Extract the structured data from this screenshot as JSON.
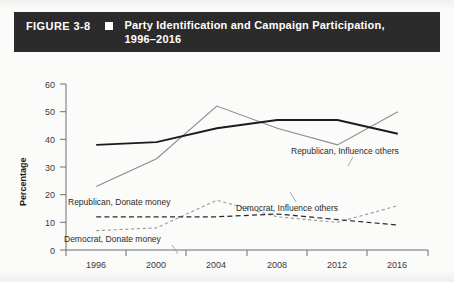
{
  "figure": {
    "number": "FIGURE 3-8",
    "bullet_icon": "square-bullet-icon",
    "title_line1": "Party Identification and Campaign Participation,",
    "title_line2": "1996–2016"
  },
  "chart_data": {
    "type": "line",
    "title": "Party Identification and Campaign Participation, 1996–2016",
    "xlabel": "",
    "ylabel": "Percentage",
    "categories": [
      "1996",
      "2000",
      "2004",
      "2008",
      "2012",
      "2016"
    ],
    "x": [
      1996,
      2000,
      2004,
      2008,
      2012,
      2016
    ],
    "ylim": [
      0,
      60
    ],
    "yticks": [
      0,
      10,
      20,
      30,
      40,
      50,
      60
    ],
    "grid": false,
    "legend": "inline-labels",
    "series": [
      {
        "name": "Republican, Influence others",
        "style": "solid",
        "color": "#1b1b1b",
        "values": [
          38,
          39,
          44,
          47,
          47,
          42
        ]
      },
      {
        "name": "Democrat, Influence others",
        "style": "solid",
        "color": "#8d8d8d",
        "values": [
          23,
          33,
          52,
          44,
          38,
          50
        ]
      },
      {
        "name": "Republican, Donate money",
        "style": "dashed",
        "color": "#2a2a2a",
        "values": [
          12,
          12,
          12,
          13,
          11,
          9
        ]
      },
      {
        "name": "Democrat, Donate money",
        "style": "dashed-fine",
        "color": "#9a9a9a",
        "values": [
          7,
          8,
          18,
          12,
          10,
          16
        ]
      }
    ],
    "annotations": [
      {
        "text": "Republican, Influence others",
        "x": 291,
        "y": 100
      },
      {
        "text": "Democrat, Influence others",
        "x": 236,
        "y": 152
      },
      {
        "text": "Republican, Donate money",
        "x": 66,
        "y": 204
      },
      {
        "text": "Democrat, Donate money",
        "x": 63,
        "y": 241
      }
    ]
  }
}
